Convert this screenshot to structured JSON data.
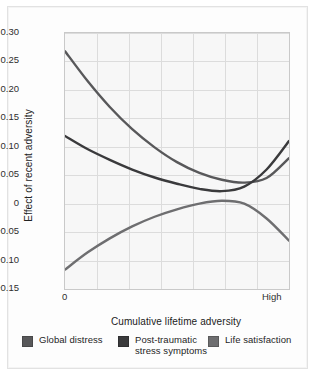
{
  "figure": {
    "background": "#ffffff",
    "card_background": "#fdfdfd"
  },
  "chart_data": {
    "type": "line",
    "title": "",
    "subtitle": "",
    "xlabel": "Cumulative lifetime adversity",
    "ylabel": "Effect of recent adversity",
    "xlim": [
      0,
      1
    ],
    "ylim": [
      -0.15,
      0.3
    ],
    "x_tick_labels": [
      "0",
      "High"
    ],
    "y_ticks": [
      0.3,
      0.25,
      0.2,
      0.15,
      0.1,
      0.05,
      0,
      -0.05,
      -0.1,
      -0.15
    ],
    "y_tick_labels": [
      "0.30",
      "0.25",
      "0.20",
      "0.15",
      "0.10",
      "0.05",
      "0",
      "-0.05",
      "-0.10",
      "-0.15"
    ],
    "grid": true,
    "grid_color": "#dcdcdc",
    "plot_background": "#f7f7f7",
    "legend_position": "bottom",
    "x": [
      0,
      0.1,
      0.2,
      0.3,
      0.4,
      0.5,
      0.6,
      0.7,
      0.8,
      0.9,
      1.0
    ],
    "series": [
      {
        "name": "Global distress",
        "color": "#58585a",
        "values": [
          0.268,
          0.216,
          0.17,
          0.131,
          0.099,
          0.073,
          0.054,
          0.042,
          0.037,
          0.045,
          0.08
        ]
      },
      {
        "name": "Post-traumatic stress symptoms",
        "color": "#3a3a3c",
        "values": [
          0.119,
          0.096,
          0.077,
          0.06,
          0.046,
          0.035,
          0.026,
          0.022,
          0.03,
          0.06,
          0.11
        ]
      },
      {
        "name": "Life satisfaction",
        "color": "#6e6e70",
        "values": [
          -0.116,
          -0.086,
          -0.061,
          -0.04,
          -0.023,
          -0.01,
          0.0,
          0.005,
          0.0,
          -0.026,
          -0.065
        ]
      }
    ],
    "annotations": []
  },
  "legend": {
    "items": [
      {
        "label": "Global distress",
        "color": "#58585a"
      },
      {
        "label": "Post-traumatic stress symptoms",
        "color": "#3a3a3c"
      },
      {
        "label": "Life satisfaction",
        "color": "#6e6e70"
      }
    ]
  }
}
